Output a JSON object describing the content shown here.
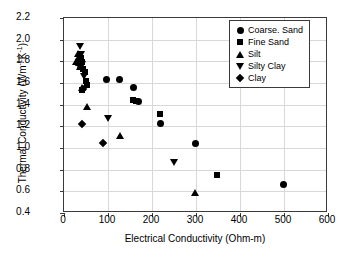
{
  "chart_data": {
    "type": "scatter",
    "title": "",
    "xlabel": "Electrical Conductivity (Ohm-m)",
    "ylabel_prefix": "Thermal Conductivity (Wm",
    "ylabel_sup1": "-1",
    "ylabel_mid": "K",
    "ylabel_sup2": "-1",
    "ylabel_suffix": ")",
    "ylabel_plain": "Thermal Conductivity (Wm-1K-1)",
    "xlim": [
      0,
      600
    ],
    "ylim": [
      0.4,
      2.2
    ],
    "xticks": [
      0,
      100,
      200,
      300,
      400,
      500,
      600
    ],
    "yticks": [
      0.4,
      0.6,
      0.8,
      1.0,
      1.2,
      1.4,
      1.6,
      1.8,
      2.0,
      2.2
    ],
    "xtick_labels": [
      "0",
      "100",
      "200",
      "300",
      "400",
      "500",
      "600"
    ],
    "ytick_labels": [
      "0.4",
      "0.6",
      "0.8",
      "1.0",
      "1.2",
      "1.4",
      "1.6",
      "1.8",
      "2.0",
      "2.2"
    ],
    "grid": true,
    "legend_position": "upper right",
    "marker_color": "#000000",
    "series": [
      {
        "name": "Coarse. Sand",
        "marker": "circle",
        "points": [
          {
            "x": 97,
            "y": 1.63
          },
          {
            "x": 127,
            "y": 1.635
          },
          {
            "x": 158,
            "y": 1.555
          },
          {
            "x": 170,
            "y": 1.425
          },
          {
            "x": 219,
            "y": 1.225
          },
          {
            "x": 299,
            "y": 1.04
          },
          {
            "x": 498,
            "y": 0.66
          }
        ]
      },
      {
        "name": "Fine Sand",
        "marker": "square",
        "points": [
          {
            "x": 38,
            "y": 1.83
          },
          {
            "x": 41,
            "y": 1.79
          },
          {
            "x": 44,
            "y": 1.73
          },
          {
            "x": 47,
            "y": 1.7
          },
          {
            "x": 50,
            "y": 1.62
          },
          {
            "x": 52,
            "y": 1.585
          },
          {
            "x": 42,
            "y": 1.535
          },
          {
            "x": 156,
            "y": 1.44
          },
          {
            "x": 163,
            "y": 1.435
          },
          {
            "x": 219,
            "y": 1.315
          },
          {
            "x": 348,
            "y": 0.755
          }
        ]
      },
      {
        "name": "Silt",
        "marker": "triangle",
        "points": [
          {
            "x": 27,
            "y": 1.8
          },
          {
            "x": 31,
            "y": 1.875
          },
          {
            "x": 33,
            "y": 1.845
          },
          {
            "x": 35,
            "y": 1.785
          },
          {
            "x": 37,
            "y": 1.755
          },
          {
            "x": 40,
            "y": 1.555
          },
          {
            "x": 52,
            "y": 1.38
          },
          {
            "x": 128,
            "y": 1.115
          },
          {
            "x": 297,
            "y": 0.585
          }
        ]
      },
      {
        "name": "Silty Clay",
        "marker": "triangle-down",
        "points": [
          {
            "x": 36,
            "y": 1.935
          },
          {
            "x": 38,
            "y": 1.86
          },
          {
            "x": 41,
            "y": 1.77
          },
          {
            "x": 45,
            "y": 1.66
          },
          {
            "x": 99,
            "y": 1.27
          },
          {
            "x": 250,
            "y": 0.87
          }
        ]
      },
      {
        "name": "Clay",
        "marker": "diamond",
        "points": [
          {
            "x": 34,
            "y": 1.815
          },
          {
            "x": 38,
            "y": 1.745
          },
          {
            "x": 43,
            "y": 1.545
          },
          {
            "x": 40,
            "y": 1.225
          },
          {
            "x": 89,
            "y": 1.045
          }
        ]
      }
    ]
  }
}
